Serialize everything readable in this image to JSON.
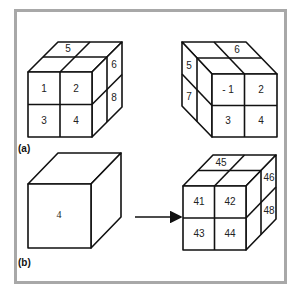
{
  "figure": {
    "panels": [
      {
        "id": "a",
        "label": "(a)",
        "cubes": [
          {
            "name": "cube-front-view",
            "front_labels": [
              "1",
              "2",
              "3",
              "4"
            ],
            "top_labels": [
              "5"
            ],
            "side_labels": [
              "6",
              "8"
            ]
          },
          {
            "name": "cube-rotated-view",
            "front_labels": [
              "- 1",
              "2",
              "3",
              "4"
            ],
            "top_labels": [
              "6"
            ],
            "side_labels": [
              "5",
              "7"
            ]
          }
        ]
      },
      {
        "id": "b",
        "label": "(b)",
        "cubes": [
          {
            "name": "single-cube",
            "front_labels": [
              "4"
            ]
          },
          {
            "name": "subdivided-cube",
            "front_labels": [
              "41",
              "42",
              "43",
              "44"
            ],
            "top_labels": [
              "45"
            ],
            "side_labels": [
              "46",
              "48"
            ]
          }
        ],
        "arrow": "right"
      }
    ]
  }
}
